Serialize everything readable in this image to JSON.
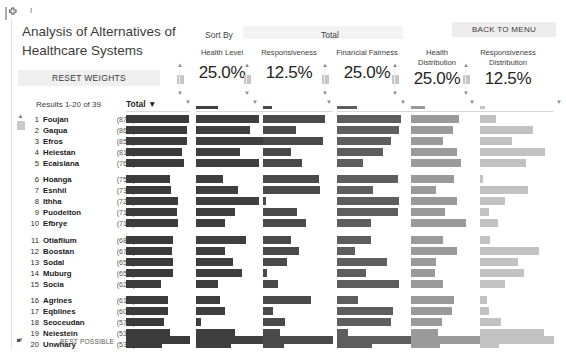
{
  "app": {
    "icon": "health-plus-icon",
    "title": "Analysis of Alternatives of Healthcare Systems",
    "tick_mark": "I"
  },
  "buttons": {
    "reset_weights": "RESET WEIGHTS",
    "back_to_menu": "BACK TO MENU"
  },
  "labels": {
    "sort_by": "Sort By",
    "total_top": "Total",
    "results_count": "Results 1-20 of 39",
    "total_header": "Total ▼",
    "best_possible": "BEST POSSIBLE"
  },
  "weights": [
    {
      "label": "Health Level",
      "value": "25.0%",
      "two_line": false
    },
    {
      "label": "Responsiveness",
      "value": "12.5%",
      "two_line": false
    },
    {
      "label": "Financial Fairness",
      "value": "25.0%",
      "two_line": false
    },
    {
      "label": "Health Distribution",
      "value": "25.0%",
      "two_line": true
    },
    {
      "label": "Responsiveness Distribution",
      "value": "12.5%",
      "two_line": true
    }
  ],
  "colors": {
    "total_bar": "#3b3b3b",
    "col1_bar": "#3f3f3f",
    "col2_bar": "#4a4a4a",
    "col3_bar": "#5e5e5e",
    "col4_bar": "#9a9a9a",
    "col5_bar": "#c2c2c2",
    "button_bg": "#efefef",
    "text": "#3c3c3c"
  },
  "columns": {
    "total_x": 126,
    "total_w": 64,
    "c1_x": 196,
    "c1_w": 68,
    "c2_x": 263,
    "c2_w": 70,
    "c3_x": 337,
    "c3_w": 80,
    "c4_x": 411,
    "c4_w": 70,
    "c5_x": 480,
    "c5_w": 74
  },
  "rows": [
    {
      "rank": "1",
      "name": "Foujan",
      "score": "(87.5)",
      "total": 0.98,
      "c1": 0.92,
      "c2": 0.88,
      "c3": 0.8,
      "c4": 0.68,
      "c5": 0.22
    },
    {
      "rank": "2",
      "name": "Gaqua",
      "score": "(86.3)",
      "total": 0.96,
      "c1": 0.8,
      "c2": 0.47,
      "c3": 0.78,
      "c4": 0.6,
      "c5": 0.72
    },
    {
      "rank": "3",
      "name": "Efros",
      "score": "(85.0)",
      "total": 0.96,
      "c1": 1.0,
      "c2": 0.86,
      "c3": 0.68,
      "c4": 0.45,
      "c5": 0.43
    },
    {
      "rank": "4",
      "name": "Heiestan",
      "score": "(81.3)",
      "total": 0.88,
      "c1": 0.64,
      "c2": 0.4,
      "c3": 0.58,
      "c4": 0.65,
      "c5": 0.88
    },
    {
      "rank": "5",
      "name": "Ecaislana",
      "score": "(76.3)",
      "total": 0.9,
      "c1": 0.92,
      "c2": 0.56,
      "c3": 0.33,
      "c4": 0.72,
      "c5": 0.62
    },
    {
      "rank": "6",
      "name": "Hoanga",
      "score": "(75.0)",
      "total": 0.69,
      "c1": 0.4,
      "c2": 0.8,
      "c3": 0.76,
      "c4": 0.62,
      "c5": 0.04
    },
    {
      "rank": "7",
      "name": "Esnhil",
      "score": "(73.8)",
      "total": 0.71,
      "c1": 0.62,
      "c2": 0.82,
      "c3": 0.45,
      "c4": 0.36,
      "c5": 0.65
    },
    {
      "rank": "8",
      "name": "Ithha",
      "score": "(72.5)",
      "total": 0.82,
      "c1": 0.92,
      "c2": 0.04,
      "c3": 0.78,
      "c4": 0.66,
      "c5": 0.34
    },
    {
      "rank": "9",
      "name": "Puodeiton",
      "score": "(71.3)",
      "total": 0.8,
      "c1": 0.58,
      "c2": 0.48,
      "c3": 0.76,
      "c4": 0.48,
      "c5": 0.12
    },
    {
      "rank": "10",
      "name": "Efbrye",
      "score": "(71.3)",
      "total": 0.82,
      "c1": 0.42,
      "c2": 0.62,
      "c3": 0.42,
      "c4": 0.78,
      "c5": 0.24
    },
    {
      "rank": "11",
      "name": "Otiaflium",
      "score": "(68.8)",
      "total": 0.74,
      "c1": 0.74,
      "c2": 0.4,
      "c3": 0.42,
      "c4": 0.46,
      "c5": 0.14
    },
    {
      "rank": "12",
      "name": "Boostan",
      "score": "(67.5)",
      "total": 0.72,
      "c1": 0.42,
      "c2": 0.52,
      "c3": 0.22,
      "c4": 0.66,
      "c5": 0.8
    },
    {
      "rank": "13",
      "name": "Sodal",
      "score": "(65.0)",
      "total": 0.74,
      "c1": 0.54,
      "c2": 0.34,
      "c3": 0.62,
      "c4": 0.36,
      "c5": 0.52
    },
    {
      "rank": "14",
      "name": "Muburg",
      "score": "(65.0)",
      "total": 0.74,
      "c1": 0.68,
      "c2": 0.06,
      "c3": 0.36,
      "c4": 0.34,
      "c5": 0.6
    },
    {
      "rank": "15",
      "name": "Socia",
      "score": "(62.5)",
      "total": 0.54,
      "c1": 0.32,
      "c2": 0.22,
      "c3": 0.78,
      "c4": 0.46,
      "c5": 0.34
    },
    {
      "rank": "16",
      "name": "Agrines",
      "score": "(61.3)",
      "total": 0.66,
      "c1": 0.36,
      "c2": 0.68,
      "c3": 0.26,
      "c4": 0.62,
      "c5": 0.1
    },
    {
      "rank": "17",
      "name": "Eqblines",
      "score": "(60.0)",
      "total": 0.66,
      "c1": 0.42,
      "c2": 0.14,
      "c3": 0.7,
      "c4": 0.58,
      "c5": 0.12
    },
    {
      "rank": "18",
      "name": "Seoceudan",
      "score": "(57.5)",
      "total": 0.6,
      "c1": 0.08,
      "c2": 0.32,
      "c3": 0.68,
      "c4": 0.44,
      "c5": 0.28
    },
    {
      "rank": "19",
      "name": "Neiestein",
      "score": "(53.8)",
      "total": 0.68,
      "c1": 0.58,
      "c2": 0.24,
      "c3": 0.14,
      "c4": 0.38,
      "c5": 0.86
    },
    {
      "rank": "20",
      "name": "Unwhary",
      "score": "(53.8)",
      "total": 0.56,
      "c1": 0.52,
      "c2": 0.3,
      "c3": 0.44,
      "c4": 0.42,
      "c5": 0.26
    }
  ],
  "best_possible_bars": {
    "total": 1.0,
    "c1": 1.0,
    "c2": 1.0,
    "c3": 1.0,
    "c4": 1.0,
    "c5": 1.0
  },
  "chart_data": {
    "type": "bar",
    "title": "Analysis of Alternatives of Healthcare Systems",
    "xlabel": "",
    "ylabel": "",
    "grid": false,
    "legend_position": "top",
    "categories": [
      "Foujan",
      "Gaqua",
      "Efros",
      "Heiestan",
      "Ecaislana",
      "Hoanga",
      "Esnhil",
      "Ithha",
      "Puodeiton",
      "Efbrye",
      "Otiaflium",
      "Boostan",
      "Sodal",
      "Muburg",
      "Socia",
      "Agrines",
      "Eqblines",
      "Seoceudan",
      "Neiestein",
      "Unwhary"
    ],
    "series": [
      {
        "name": "Total",
        "weight": "100%",
        "values": [
          87.5,
          86.3,
          85.0,
          81.3,
          76.3,
          75.0,
          73.8,
          72.5,
          71.3,
          71.3,
          68.8,
          67.5,
          65.0,
          65.0,
          62.5,
          61.3,
          60.0,
          57.5,
          53.8,
          53.8
        ]
      },
      {
        "name": "Health Level",
        "weight": "25.0%",
        "values": [
          92,
          80,
          100,
          64,
          92,
          40,
          62,
          92,
          58,
          42,
          74,
          42,
          54,
          68,
          32,
          36,
          42,
          8,
          58,
          52
        ]
      },
      {
        "name": "Responsiveness",
        "weight": "12.5%",
        "values": [
          88,
          47,
          86,
          40,
          56,
          80,
          82,
          4,
          48,
          62,
          40,
          52,
          34,
          6,
          22,
          68,
          14,
          32,
          24,
          30
        ]
      },
      {
        "name": "Financial Fairness",
        "weight": "25.0%",
        "values": [
          80,
          78,
          68,
          58,
          33,
          76,
          45,
          78,
          76,
          42,
          42,
          22,
          62,
          36,
          78,
          26,
          70,
          68,
          14,
          44
        ]
      },
      {
        "name": "Health Distribution",
        "weight": "25.0%",
        "values": [
          68,
          60,
          45,
          65,
          72,
          62,
          36,
          66,
          48,
          78,
          46,
          66,
          36,
          34,
          46,
          62,
          58,
          44,
          38,
          42
        ]
      },
      {
        "name": "Responsiveness Distribution",
        "weight": "12.5%",
        "values": [
          22,
          72,
          43,
          88,
          62,
          4,
          65,
          34,
          12,
          24,
          14,
          80,
          52,
          60,
          34,
          10,
          12,
          28,
          86,
          26
        ]
      }
    ],
    "ylim": [
      0,
      100
    ]
  }
}
